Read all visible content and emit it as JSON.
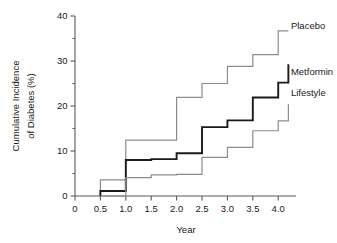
{
  "chart_data": {
    "type": "line",
    "subtype": "step",
    "title": "",
    "xlabel": "Year",
    "ylabel": "Cumulative Incidence of Diabetes (%)",
    "ylabel_line1": "Cumulative Incidence",
    "ylabel_line2": "of Diabetes (%)",
    "xlim": [
      0,
      4.35
    ],
    "ylim": [
      0,
      40
    ],
    "xticks": [
      0,
      0.5,
      1.0,
      1.5,
      2.0,
      2.5,
      3.0,
      3.5,
      4.0
    ],
    "xticklabels": [
      "0",
      "0.5",
      "1.0",
      "1.5",
      "2.0",
      "2.5",
      "3.0",
      "3.5",
      "4.0"
    ],
    "yticks": [
      0,
      10,
      20,
      30,
      40
    ],
    "yticklabels": [
      "0",
      "10",
      "20",
      "30",
      "40"
    ],
    "yminorticks": [
      5,
      15,
      25,
      35
    ],
    "grid": false,
    "legend_position": "right-inline",
    "x": [
      0.5,
      1.0,
      1.5,
      2.0,
      2.5,
      3.0,
      3.5,
      4.0,
      4.2
    ],
    "series": [
      {
        "name": "Placebo",
        "color": "#8c8c8c",
        "linewidth": 1.2,
        "values": [
          3.6,
          12.4,
          12.4,
          21.9,
          25.0,
          28.8,
          31.4,
          36.7,
          36.7
        ],
        "label_x": 4.25,
        "label_y": 37.8
      },
      {
        "name": "Metformin",
        "color": "#1a1a1a",
        "linewidth": 1.9,
        "values": [
          1.1,
          8.0,
          8.2,
          9.5,
          15.3,
          16.8,
          21.9,
          25.2,
          29.3
        ],
        "label_x": 4.25,
        "label_y": 27.6
      },
      {
        "name": "Lifestyle",
        "color": "#8c8c8c",
        "linewidth": 1.2,
        "values": [
          0.0,
          4.1,
          4.7,
          4.8,
          8.6,
          10.8,
          14.5,
          16.7,
          20.4
        ],
        "label_x": 4.25,
        "label_y": 23.0
      }
    ]
  }
}
